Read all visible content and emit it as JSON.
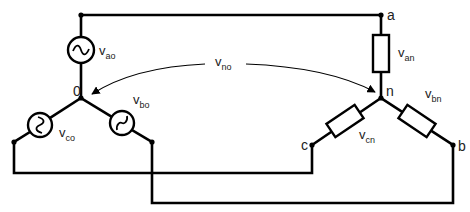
{
  "diagram": {
    "nodes": {
      "source_neutral": "0",
      "load_neutral": "n",
      "a": "a",
      "b": "b",
      "c": "c"
    },
    "sources": [
      {
        "id": "ao",
        "symbol": "v",
        "subscript": "ao",
        "icon": "ac-source-icon"
      },
      {
        "id": "bo",
        "symbol": "v",
        "subscript": "bo",
        "icon": "ac-source-icon"
      },
      {
        "id": "co",
        "symbol": "v",
        "subscript": "co",
        "icon": "ac-source-icon"
      }
    ],
    "loads": [
      {
        "id": "an",
        "symbol": "v",
        "subscript": "an",
        "icon": "resistor-icon"
      },
      {
        "id": "bn",
        "symbol": "v",
        "subscript": "bn",
        "icon": "resistor-icon"
      },
      {
        "id": "cn",
        "symbol": "v",
        "subscript": "cn",
        "icon": "resistor-icon"
      }
    ],
    "neutral_voltage": {
      "symbol": "v",
      "subscript": "no",
      "icon": "double-arrow-icon"
    },
    "colors": {
      "line": "#000000",
      "text": "#222222",
      "background": "#ffffff"
    }
  }
}
